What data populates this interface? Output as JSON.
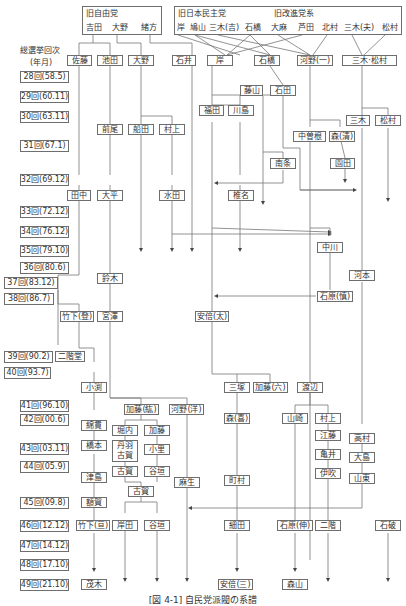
{
  "header_groups": {
    "old_liberal": {
      "title": "旧自由党",
      "members": [
        "吉田",
        "大野",
        "緒方"
      ]
    },
    "old_democrat": {
      "title": "旧日本民主党",
      "members": [
        "岸",
        "鳩山",
        "三木(吉)",
        "石橋",
        "大麻",
        "芦田",
        "北村"
      ]
    },
    "old_progressive": {
      "title": "旧改進党系",
      "members": [
        "三木(夫)",
        "松村"
      ]
    }
  },
  "axis": {
    "title_line1": "総選挙回次",
    "title_line2": "(年月)",
    "elections": [
      "28回(58.5)",
      "29回(60.11)",
      "30回(63.11)",
      "31回(67.1)",
      "32回(69.12)",
      "33回(72.12)",
      "34回(76.12)",
      "35回(79.10)",
      "36回(80.6)",
      "37回(83.12)",
      "38回(86.7)",
      "39回(90.2)",
      "40回(93.7)",
      "41回(96.10)",
      "42回(00.6)",
      "43回(03.11)",
      "44回(05.9)",
      "45回(09.8)",
      "46回(12.12)",
      "47回(14.12)",
      "48回(17.10)",
      "49回(21.10)"
    ]
  },
  "factions": {
    "sato": "佐藤",
    "ikeda": "池田",
    "ono": "大野",
    "ishii": "石井",
    "kishi": "岸",
    "ishibashi": "石橋",
    "kono1": "河野(一)",
    "miki_matsumura": "三木·松村",
    "fujiyama": "藤山",
    "ishida": "石田",
    "fukuda": "福田",
    "kawashima": "川島",
    "miki": "三木",
    "matsumura": "松村",
    "maeo": "前尾",
    "funada": "船田",
    "murakami": "村上",
    "nakasone": "中曽根",
    "mori_kiyoshi": "森(清)",
    "nanjo": "南条",
    "sonoda": "園田",
    "tanaka": "田中",
    "ohira": "大平",
    "mizuta": "水田",
    "shiina": "椎名",
    "nakagawa": "中川",
    "komoto": "河本",
    "suzuki": "鈴木",
    "ishihara_shintaro": "石原(慎)",
    "takeshita_noboru": "竹下(登)",
    "miyazawa": "宮澤",
    "abe_shintaro": "安倍(太)",
    "nikaido": "二階堂",
    "obuchi": "小渕",
    "mitsuzuka": "三塚",
    "kato_mutsuki": "加藤(六)",
    "watanabe": "渡辺",
    "kato_koichi": "加藤(紘)",
    "kono_yohei": "河野(洋)",
    "mori_yoshiro": "森(喜)",
    "yamasaki": "山崎",
    "murakami2": "村上",
    "watanuki": "綿貫",
    "horiuchi": "堀内",
    "kato2": "加藤",
    "eto": "江藤",
    "takamura": "高村",
    "hashimoto": "橋本",
    "niwa_koga": "丹羽\n古賀",
    "kosato": "小里",
    "kamei": "亀井",
    "oshima": "大島",
    "ibuki": "伊吹",
    "tsushima": "津島",
    "koga": "古賀",
    "tanigaki": "谷垣",
    "aso": "麻生",
    "machimura": "町村",
    "yamato": "山東",
    "koga2": "古賀",
    "nukaga": "額賀",
    "takeshita_wataru": "竹下(亘)",
    "kishida": "岸田",
    "tanigaki2": "谷垣",
    "hosoda": "細田",
    "ishihara_nobuteru": "石原(伸)",
    "nikai": "二階",
    "ishiba": "石破",
    "motegi": "茂木",
    "abe_shinzo": "安倍(三)",
    "moriyama": "森山"
  },
  "caption": "[図 4-1] 自民党派閥の系譜"
}
